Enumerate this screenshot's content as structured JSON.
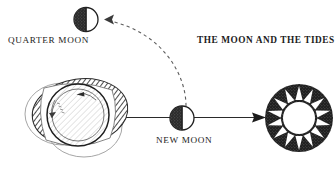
{
  "figure": {
    "title": "THE MOON AND THE TIDES",
    "background_color": "#ffffff",
    "ink_color": "#1c1c1c",
    "labels": {
      "quarter_moon": "QUARTER MOON",
      "new_moon": "NEW MOON"
    }
  },
  "diagram_data": {
    "type": "diagram",
    "subject": "Lunar phases and tidal bulges",
    "elements": [
      {
        "name": "quarter-moon",
        "kind": "moon-phase",
        "label": "QUARTER MOON",
        "lit_half": "right",
        "dark_half": "left",
        "cx": 86,
        "cy": 19,
        "r": 12
      },
      {
        "name": "new-moon",
        "kind": "moon-phase",
        "label": "NEW MOON",
        "lit_half": "right",
        "dark_half": "left",
        "cx": 182,
        "cy": 118,
        "r": 12
      },
      {
        "name": "sun",
        "kind": "sun",
        "cx": 299,
        "cy": 118,
        "outer_r": 34,
        "inner_r": 16,
        "ray_count": 14,
        "fill": "#1c1c1c"
      },
      {
        "name": "earth",
        "kind": "earth-with-tidal-bulge",
        "cx": 78,
        "cy": 116,
        "r": 33,
        "rotation": "counter-clockwise"
      },
      {
        "name": "tidal-bulge",
        "kind": "hatched-ellipse",
        "orientation": "toward-moon",
        "hatch_angle_deg": 45
      },
      {
        "name": "orbit-arrow",
        "kind": "dashed-curved-arrow",
        "from": "new-moon",
        "to": "quarter-moon",
        "style": "dashed"
      },
      {
        "name": "moon-sun-line",
        "kind": "solid-arrow",
        "from": "earth",
        "through": "new-moon",
        "to": "sun",
        "style": "solid"
      }
    ]
  }
}
